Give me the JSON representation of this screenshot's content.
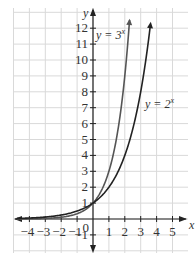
{
  "chart_data": {
    "type": "line",
    "title": "",
    "xlabel": "x",
    "ylabel": "y",
    "xlim": [
      -4.5,
      5.5
    ],
    "ylim": [
      -1,
      12.5
    ],
    "grid": true,
    "x_ticks": [
      -4,
      -3,
      -2,
      -1,
      0,
      1,
      2,
      3,
      4,
      5
    ],
    "y_ticks": [
      -1,
      1,
      2,
      3,
      4,
      5,
      6,
      7,
      8,
      9,
      10,
      11,
      12
    ],
    "origin_label": "0",
    "series": [
      {
        "name": "y = 3^x",
        "label_base": "y = 3",
        "label_exp": "x",
        "base": 3,
        "x": [
          -4,
          -3,
          -2,
          -1,
          0,
          1,
          2,
          2.3
        ],
        "y": [
          0.012,
          0.037,
          0.111,
          0.333,
          1,
          3,
          9,
          12.5
        ]
      },
      {
        "name": "y = 2^x",
        "label_base": "y = 2",
        "label_exp": "x",
        "base": 2,
        "x": [
          -4,
          -3,
          -2,
          -1,
          0,
          1,
          2,
          3,
          3.6
        ],
        "y": [
          0.0625,
          0.125,
          0.25,
          0.5,
          1,
          2,
          4,
          8,
          12.1
        ]
      }
    ],
    "colors": {
      "curve_3x": "#555555",
      "curve_2x": "#222222",
      "grid": "#d9d9d9",
      "axis": "#222222"
    }
  }
}
